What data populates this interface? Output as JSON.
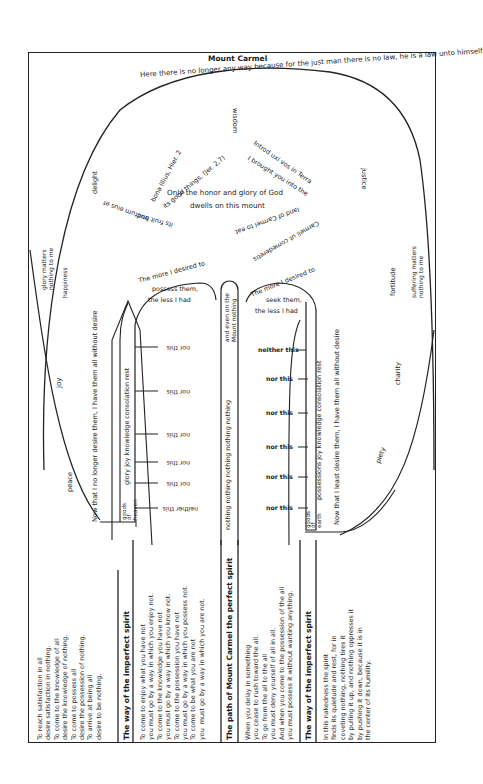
{
  "diagram": {
    "title": "Mount Carmel",
    "summit_arc_text": "Here there is no longer any way because for the just man there is no law, he is a law unto himself",
    "center": {
      "line1": "Only the honor and glory of God",
      "line2": "dwells on this mount",
      "ring_left_top": "bona Illius, Hier. 2",
      "ring_left_inner": "its good things, (Jer. 2,7)",
      "ring_left_bottom_outer": "fructum eius et",
      "ring_left_bottom_inner": "its fruit and",
      "ring_right_top": "Introd uxi vos in Terra",
      "ring_right_inner": "I brought you into the",
      "ring_right_mid": "land of Carmel to eat",
      "ring_right_bottom": "Carmeli ut comederetis"
    },
    "virtues": {
      "wisdom": "wisdom",
      "justice": "justice",
      "delight": "delight",
      "glory_matters": "glory matters\nnothing to me",
      "happiness": "happiness",
      "joy": "joy",
      "peace": "peace",
      "fortitude": "fortitude",
      "suffering_matters": "suffering matters\nnothing to me",
      "charity": "charity",
      "piety": "piety"
    },
    "left_path": {
      "arch_text": [
        "The more I desired to",
        "possess them,",
        "the less I had"
      ],
      "column_text": "Now that I no longer desire them, I have them all without desire",
      "goods_label": "goods\nof\nheaven",
      "goods_list": "glory joy knowledge consolation rest",
      "branches": [
        "neither this",
        "nor this",
        "nor this",
        "nor this",
        "nor this",
        "nor this"
      ]
    },
    "middle_path": {
      "text": "nothing nothing nothing nothing nothing",
      "top_text": "and even on the\nMount nothing"
    },
    "right_path": {
      "arch_text": [
        "The more I desired to",
        "seek them,",
        "the less I had"
      ],
      "column_text": "Now that I least desire them, I have them all without desire",
      "goods_label": "goods\nof\nearth",
      "goods_list": "possessions joy knowledge consolation rest",
      "branches": [
        "neither this",
        "nor this",
        "nor this",
        "nor this",
        "nor this",
        "nor this"
      ]
    },
    "bottom": {
      "col1_text": "To reach satisfaction in all\ndesire satisfaction in nothing.\nTo come to the knowledge of all\ndesire the knowledge of nothing.\nTo come to possess all\ndesire the possession of nothing.\nTo arrive at being all\ndesire to be nothing.",
      "col2_header": "The way of the imperfect spirit",
      "col2_text": "To come to enjoy what you have not\nyou must go by a way in which you enjoy not.\nTo come to the knowledge you have not\nyou must go by a way in which you know not.\nTo come to the possession you have not\nyou must go by a way in which you possess not.\nTo come to be what you are not\nyou  must go by a way in which you are not.",
      "col3_header": "The path of Mount Carmel the perfect spirit",
      "col3_text": "When you delay in something\nyou cease to rush toward the all.\nTo go from the all to the all\nyou must deny yourself of all in all.\nAnd when you come to the possession of the all\nyou must possess it without wanting anything.",
      "col4_header": "The way of the imperfect spirit",
      "col4_text": "In this nakedness the spirit\nfinds its quietude and rest, for in\ncoveting nothing, nothing tires it\nby pulling it up, and nothing oppresses it\nby pushing it down, because it is in\nthe center of its humility."
    }
  }
}
